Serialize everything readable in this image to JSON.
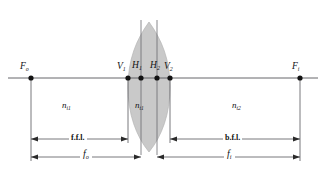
{
  "figure": {
    "type": "optical-ray-diagram",
    "background_color": "#ffffff",
    "line_color": "#55555a",
    "lens_fill_color": "#c9c9c9",
    "text_color": "#111111"
  },
  "axis": {
    "name": "optical-axis",
    "y": 78,
    "x_start": 8,
    "x_end": 318
  },
  "points": [
    {
      "id": "Fo",
      "base": "F",
      "sub": "o",
      "x": 31,
      "y": 78,
      "label_x": 20,
      "label_y": 62
    },
    {
      "id": "V1",
      "base": "V",
      "sub": "1",
      "x": 128,
      "y": 78,
      "label_x": 117,
      "label_y": 62
    },
    {
      "id": "H1",
      "base": "H",
      "sub": "1",
      "x": 141,
      "y": 78,
      "label_x": 132,
      "label_y": 61
    },
    {
      "id": "H2",
      "base": "H",
      "sub": "2",
      "x": 157,
      "y": 78,
      "label_x": 150,
      "label_y": 61
    },
    {
      "id": "V2",
      "base": "V",
      "sub": "2",
      "x": 170,
      "y": 78,
      "label_x": 164,
      "label_y": 62
    },
    {
      "id": "Fi",
      "base": "F",
      "sub": "i",
      "x": 300,
      "y": 78,
      "label_x": 292,
      "label_y": 62
    }
  ],
  "media": [
    {
      "id": "n-i1",
      "base": "n",
      "sub": "i1",
      "label_x": 62,
      "label_y": 101
    },
    {
      "id": "n-t1",
      "base": "n",
      "sub": "t1",
      "label_x": 141,
      "label_y": 101
    },
    {
      "id": "n-t2",
      "base": "n",
      "sub": "t2",
      "label_x": 232,
      "label_y": 101
    }
  ],
  "dimensions": [
    {
      "id": "ffl",
      "label": "f.f.l.",
      "y": 139,
      "x1": 31,
      "x2": 128,
      "label_x": 69,
      "label_y": 135
    },
    {
      "id": "bfl",
      "label": "b.f.l.",
      "y": 139,
      "x1": 170,
      "x2": 300,
      "label_x": 223,
      "label_y": 135
    },
    {
      "id": "fo",
      "label": "f",
      "sub": "o",
      "y": 157,
      "x1": 31,
      "x2": 141,
      "label_x": 80,
      "label_y": 150
    },
    {
      "id": "fi",
      "label": "f",
      "sub": "i",
      "y": 157,
      "x1": 157,
      "x2": 300,
      "label_x": 224,
      "label_y": 150
    }
  ],
  "lens": {
    "name": "biconvex-thick-lens",
    "left_vertex_x": 128,
    "right_vertex_x": 170,
    "top_y": 22,
    "bottom_y": 152,
    "fill": "#c9c9c9"
  },
  "principal_planes": [
    {
      "id": "H1-plane",
      "x": 141,
      "y_top": 20,
      "y_bottom": 155
    },
    {
      "id": "H2-plane",
      "x": 157,
      "y_top": 20,
      "y_bottom": 155
    }
  ]
}
